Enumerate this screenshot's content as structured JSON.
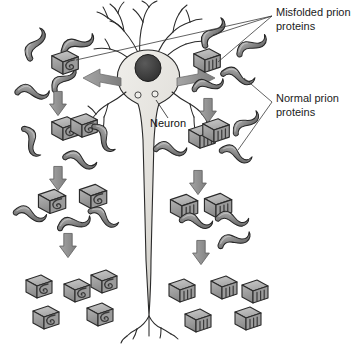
{
  "figure": {
    "background": "#ffffff",
    "width": 359,
    "height": 349
  },
  "labels": {
    "misfolded": {
      "line1": "Misfolded prion",
      "line2": "proteins",
      "x": 276,
      "y": 13
    },
    "normal": {
      "line1": "Normal prion",
      "line2": "proteins",
      "x": 276,
      "y": 99
    },
    "neuron": {
      "text": "Neuron",
      "x": 150,
      "y": 124
    }
  },
  "colors": {
    "protein_fill": "#8f8f8f",
    "protein_fill_light": "#b9b9b9",
    "protein_stroke": "#262626",
    "misfolded_fill": "#a2a2a2",
    "misfolded_top": "#c2c2c2",
    "misfolded_stroke": "#2b2b2b",
    "neuron_fill": "#e4e2de",
    "neuron_stroke": "#2a2a2a",
    "nucleus_fill": "#3a3a3a",
    "arrow_gray": "#8c8c8c",
    "arrow_dark": "#7a7a7a",
    "leader_line": "#3a3a3a",
    "text": "#1b1b1b"
  },
  "neuron": {
    "soma_center_x": 148,
    "soma_center_y": 72,
    "nucleus_x": 148,
    "nucleus_y": 68,
    "has_dendrites": true,
    "has_axon": true,
    "axon_terminal_y": 320
  },
  "spread_arrows": [
    {
      "name": "soma-arrow-left",
      "direction": "left"
    },
    {
      "name": "soma-arrow-right",
      "direction": "right"
    }
  ],
  "cascade": {
    "left": {
      "stages": [
        {
          "stage": 1,
          "misfolded_count": 1,
          "normal_count": 4,
          "shape": "spiral-block"
        },
        {
          "stage": 2,
          "misfolded_count": 2,
          "normal_count": 3,
          "shape": "spiral-block"
        },
        {
          "stage": 3,
          "misfolded_count": 2,
          "normal_count": 3,
          "shape": "spiral-block"
        },
        {
          "stage": 4,
          "misfolded_count": 5,
          "normal_count": 0,
          "shape": "spiral-block"
        }
      ],
      "arrow_count": 3
    },
    "right": {
      "stages": [
        {
          "stage": 1,
          "misfolded_count": 1,
          "normal_count": 4,
          "shape": "ribbed-block"
        },
        {
          "stage": 2,
          "misfolded_count": 2,
          "normal_count": 3,
          "shape": "ribbed-block"
        },
        {
          "stage": 3,
          "misfolded_count": 2,
          "normal_count": 3,
          "shape": "ribbed-block"
        },
        {
          "stage": 4,
          "misfolded_count": 5,
          "normal_count": 0,
          "shape": "ribbed-block"
        }
      ],
      "arrow_count": 3
    }
  }
}
